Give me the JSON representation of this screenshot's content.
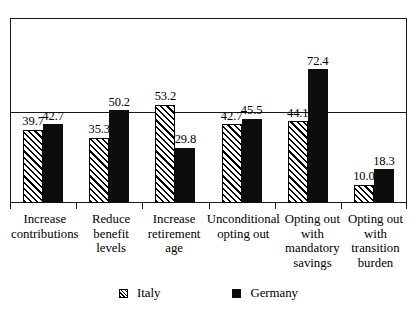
{
  "chart_data": {
    "type": "bar",
    "title": "",
    "subtitle": "",
    "xlabel": "",
    "ylabel": "",
    "ylim": [
      0,
      100
    ],
    "grid": true,
    "gridline_values": [
      50
    ],
    "legend_position": "bottom",
    "categories": [
      "Increase contributions",
      "Reduce benefit levels",
      "Increase retirement age",
      "Unconditional opting out",
      "Opting out with mandatory savings",
      "Opting out with transition burden"
    ],
    "category_lines": [
      [
        "Increase",
        "contributions"
      ],
      [
        "Reduce",
        "benefit",
        "levels"
      ],
      [
        "Increase",
        "retirement",
        "age"
      ],
      [
        "Unconditional",
        "opting out"
      ],
      [
        "Opting out",
        "with",
        "mandatory",
        "savings"
      ],
      [
        "Opting out",
        "with",
        "transition",
        "burden"
      ]
    ],
    "series": [
      {
        "name": "Italy",
        "style": "hatched",
        "color": "#ffffff",
        "values": [
          39.7,
          35.3,
          53.2,
          42.7,
          44.1,
          10.0
        ],
        "labels": [
          "39.7",
          "35.3",
          "53.2",
          "42.7",
          "44.1",
          "10.0"
        ]
      },
      {
        "name": "Germany",
        "style": "solid",
        "color": "#0d0d0d",
        "values": [
          42.7,
          50.2,
          29.8,
          45.5,
          72.4,
          18.3
        ],
        "labels": [
          "42.7",
          "50.2",
          "29.8",
          "45.5",
          "72.4",
          "18.3"
        ]
      }
    ]
  },
  "legend": {
    "entries": [
      {
        "label": "Italy",
        "swatch": "hatched-square-icon"
      },
      {
        "label": "Germany",
        "swatch": "solid-square-icon"
      }
    ]
  }
}
